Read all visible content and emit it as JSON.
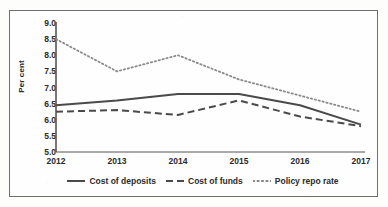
{
  "chart_data": {
    "type": "line",
    "title": "",
    "xlabel": "",
    "ylabel": "Per cent",
    "categories": [
      "2012",
      "2013",
      "2014",
      "2015",
      "2016",
      "2017"
    ],
    "x": [
      2012,
      2013,
      2014,
      2015,
      2016,
      2017
    ],
    "ylim": [
      5.0,
      9.0
    ],
    "ytick_labels": [
      "9.0",
      "8.5",
      "8.0",
      "7.5",
      "7.0",
      "6.5",
      "6.0",
      "5.5",
      "5.0"
    ],
    "ytick_values": [
      9.0,
      8.5,
      8.0,
      7.5,
      7.0,
      6.5,
      6.0,
      5.5,
      5.0
    ],
    "grid": false,
    "legend_position": "bottom",
    "series": [
      {
        "name": "Cost of deposits",
        "style": "solid",
        "color": "#4a4a4a",
        "values": [
          6.45,
          6.6,
          6.8,
          6.8,
          6.45,
          5.85
        ]
      },
      {
        "name": "Cost of funds",
        "style": "dashed",
        "color": "#4a4a4a",
        "values": [
          6.25,
          6.3,
          6.15,
          6.6,
          6.1,
          5.8
        ]
      },
      {
        "name": "Policy repo rate",
        "style": "dotted",
        "color": "#8a8a8a",
        "values": [
          8.5,
          7.5,
          8.0,
          7.25,
          6.75,
          6.25
        ]
      }
    ]
  },
  "axis": {
    "y_label": "Per cent"
  },
  "legend": {
    "items": [
      {
        "label": "Cost of deposits"
      },
      {
        "label": "Cost of funds"
      },
      {
        "label": "Policy repo rate"
      }
    ]
  }
}
